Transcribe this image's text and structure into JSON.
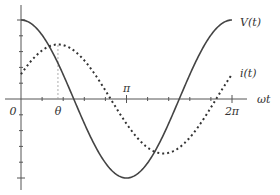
{
  "chart_data": {
    "type": "line",
    "title": "",
    "xlabel": "ωt",
    "ylabel": "",
    "xlim": [
      0,
      6.6
    ],
    "ylim": [
      -1.05,
      1.05
    ],
    "grid": false,
    "x_tick_labels": [
      {
        "value": 0,
        "label": "0"
      },
      {
        "value": 1.1,
        "label": "θ"
      },
      {
        "value": 3.14159,
        "label": "π"
      },
      {
        "value": 6.28318,
        "label": "2π"
      }
    ],
    "x_minor_ticks_per_pi": 5,
    "y_ticks_per_side": 5,
    "phase_shift_theta": 1.1,
    "series": [
      {
        "name": "V(t)",
        "label": "V(t)",
        "style": "solid",
        "function": "cos(x)",
        "amplitude": 1.0,
        "phase": 0
      },
      {
        "name": "i(t)",
        "label": "i(t)",
        "style": "dotted",
        "function": "0.69*cos(x - theta)",
        "amplitude": 0.69,
        "phase": 1.1
      }
    ]
  }
}
